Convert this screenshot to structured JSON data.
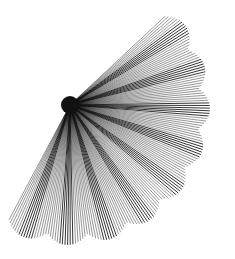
{
  "figure": {
    "center": [
      70,
      105
    ],
    "start_angle_deg": -43,
    "end_angle_deg": 118,
    "base_radius": 140,
    "ray_count": 150,
    "scallop_count": 9,
    "scallop_depth": 10,
    "line_color": "#111111",
    "background": "#ffffff"
  }
}
